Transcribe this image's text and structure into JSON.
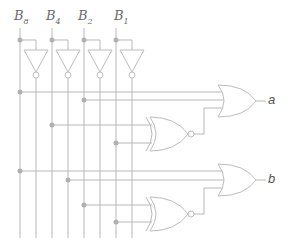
{
  "inputs": [
    {
      "name": "B",
      "sub": "8"
    },
    {
      "name": "B",
      "sub": "4"
    },
    {
      "name": "B",
      "sub": "2"
    },
    {
      "name": "B",
      "sub": "1"
    }
  ],
  "outputs": {
    "a": "a",
    "b": "b"
  },
  "colors": {
    "wire": "#b8b8b8",
    "dot": "#b0b0b0",
    "text": "#6a6a6a"
  }
}
